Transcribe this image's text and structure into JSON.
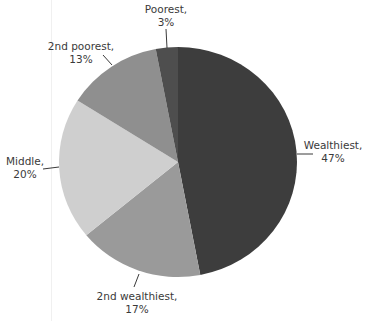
{
  "chart_data": {
    "type": "pie",
    "title": "",
    "start_angle_deg": 0,
    "direction": "clockwise",
    "slices": [
      {
        "name": "Wealthiest",
        "value": 47,
        "label": "Wealthiest,",
        "pct": "47%",
        "color": "#3d3d3d"
      },
      {
        "name": "2nd wealthiest",
        "value": 17,
        "label": "2nd wealthiest,",
        "pct": "17%",
        "color": "#9a9a9a"
      },
      {
        "name": "Middle",
        "value": 20,
        "label": "Middle,",
        "pct": "20%",
        "color": "#cfcfcf"
      },
      {
        "name": "2nd poorest",
        "value": 13,
        "label": "2nd poorest,",
        "pct": "13%",
        "color": "#8f8f8f"
      },
      {
        "name": "Poorest",
        "value": 3,
        "label": "Poorest,",
        "pct": "3%",
        "color": "#4e4e4e"
      }
    ],
    "categories": [
      "Wealthiest",
      "2nd wealthiest",
      "Middle",
      "2nd poorest",
      "Poorest"
    ],
    "values": [
      47,
      17,
      20,
      13,
      3
    ],
    "legend": "none (labels with leader lines)"
  }
}
